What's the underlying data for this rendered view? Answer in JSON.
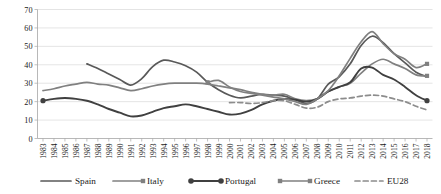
{
  "chart_data": {
    "type": "line",
    "title": "",
    "xlabel": "",
    "ylabel": "",
    "ylim": [
      0,
      70
    ],
    "ytick_step": 10,
    "yticks": [
      0,
      10,
      20,
      30,
      40,
      50,
      60,
      70
    ],
    "grid": true,
    "legend_position": "bottom",
    "categories": [
      "1983",
      "1984",
      "1985",
      "1986",
      "1987",
      "1988",
      "1989",
      "1990",
      "1991",
      "1992",
      "1993",
      "1994",
      "1995",
      "1996",
      "1997",
      "1998",
      "1999",
      "2000",
      "2001",
      "2002",
      "2003",
      "2004",
      "2005",
      "2006",
      "2007",
      "2008",
      "2009",
      "2010",
      "2011",
      "2012",
      "2013",
      "2014",
      "2015",
      "2016",
      "2017",
      "2018"
    ],
    "series": [
      {
        "name": "Spain",
        "color": "#595959",
        "style": "solid",
        "marker": "none",
        "width": 1.7,
        "values": [
          null,
          null,
          null,
          null,
          40.5,
          38.0,
          35.0,
          32.0,
          29.0,
          32.5,
          39.0,
          42.5,
          41.5,
          39.5,
          36.0,
          30.5,
          26.5,
          23.5,
          22.0,
          23.0,
          24.0,
          23.5,
          23.0,
          21.0,
          19.0,
          21.5,
          29.5,
          33.5,
          40.5,
          50.5,
          55.5,
          52.0,
          46.0,
          41.0,
          36.0,
          33.5
        ]
      },
      {
        "name": "Italy",
        "color": "#808080",
        "style": "solid",
        "marker": "arrow",
        "width": 1.7,
        "values": [
          26.0,
          27.0,
          28.5,
          29.5,
          30.5,
          29.5,
          29.0,
          27.5,
          26.0,
          27.0,
          28.5,
          29.5,
          30.0,
          30.0,
          30.0,
          29.5,
          28.5,
          27.5,
          26.5,
          25.0,
          24.0,
          23.5,
          24.0,
          21.5,
          20.5,
          21.5,
          25.5,
          28.0,
          30.0,
          35.5,
          40.5,
          43.0,
          40.5,
          38.0,
          34.5,
          34.0
        ]
      },
      {
        "name": "Portugal",
        "color": "#404040",
        "style": "solid",
        "marker": "circle",
        "width": 1.9,
        "values": [
          20.5,
          21.5,
          22.0,
          21.5,
          20.5,
          18.5,
          16.0,
          14.0,
          12.0,
          12.5,
          14.5,
          16.5,
          17.5,
          18.5,
          17.5,
          16.0,
          14.5,
          13.0,
          13.5,
          15.5,
          18.5,
          20.5,
          21.5,
          21.0,
          20.0,
          21.5,
          25.5,
          28.0,
          30.5,
          38.0,
          38.5,
          34.5,
          32.0,
          28.0,
          23.5,
          20.5
        ]
      },
      {
        "name": "Greece",
        "color": "#808080",
        "style": "solid",
        "marker": "diamond",
        "width": 1.7,
        "values": [
          null,
          null,
          null,
          null,
          null,
          null,
          null,
          null,
          null,
          null,
          null,
          null,
          null,
          null,
          null,
          30.5,
          31.5,
          28.0,
          25.5,
          24.5,
          23.5,
          22.5,
          21.5,
          20.0,
          18.5,
          21.5,
          26.0,
          34.0,
          43.5,
          52.5,
          58.0,
          51.5,
          46.0,
          43.0,
          38.5,
          40.5
        ]
      },
      {
        "name": "EU28",
        "color": "#8c8c8c",
        "style": "dashed",
        "marker": "none",
        "width": 1.7,
        "values": [
          null,
          null,
          null,
          null,
          null,
          null,
          null,
          null,
          null,
          null,
          null,
          null,
          null,
          null,
          null,
          null,
          null,
          19.5,
          19.5,
          19.0,
          19.5,
          20.5,
          20.5,
          18.5,
          16.5,
          17.0,
          20.0,
          21.5,
          22.0,
          23.0,
          23.5,
          23.0,
          21.5,
          20.0,
          17.5,
          15.5
        ]
      }
    ]
  },
  "legend": {
    "items": [
      {
        "label": "Spain"
      },
      {
        "label": "Italy"
      },
      {
        "label": "Portugal"
      },
      {
        "label": "Greece"
      },
      {
        "label": "EU28"
      }
    ]
  }
}
